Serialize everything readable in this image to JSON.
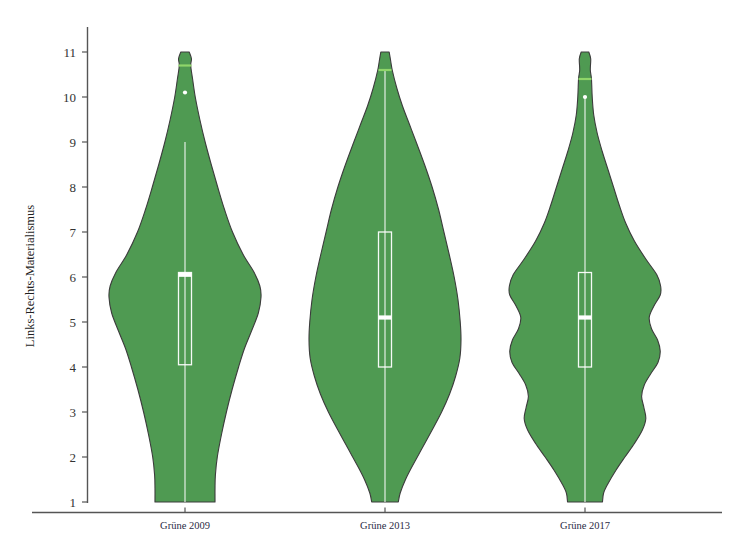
{
  "chart_data": {
    "type": "violin",
    "title": "",
    "subtitle": "",
    "xlabel": "",
    "ylabel": "Links-Rechts-Materialismus",
    "categories": [
      "Grüne 2009",
      "Grüne 2013",
      "Grüne 2017"
    ],
    "ylim": [
      1,
      11
    ],
    "yticks": [
      1,
      2,
      3,
      4,
      5,
      6,
      7,
      8,
      9,
      10,
      11
    ],
    "ytick_labels": [
      "1",
      "2",
      "3",
      "4",
      "5",
      "6",
      "7",
      "8",
      "9",
      "10",
      "11"
    ],
    "grid": false,
    "legend": "none",
    "colors": {
      "violin_fill": "#4f9a52",
      "violin_outline": "#3c3c3c",
      "box_line": "#ffffff",
      "median_line": "#ffffff",
      "whisker_line": "#ffffff",
      "cap_line": "#8fd66a",
      "outlier_point": "#ffffff",
      "axis": "#555555",
      "background": "#ffffff"
    },
    "series": [
      {
        "name": "Grüne 2009",
        "box": {
          "q1": 4.05,
          "median": 6.05,
          "q3": 6.1
        },
        "whisker_low": 1.0,
        "whisker_high": 9.0,
        "cap_high": 10.7,
        "outliers": [
          10.1
        ],
        "density": [
          {
            "y": 11.0,
            "w": 0.055
          },
          {
            "y": 10.85,
            "w": 0.085
          },
          {
            "y": 10.7,
            "w": 0.075
          },
          {
            "y": 10.4,
            "w": 0.1
          },
          {
            "y": 10.0,
            "w": 0.135
          },
          {
            "y": 9.5,
            "w": 0.195
          },
          {
            "y": 9.0,
            "w": 0.265
          },
          {
            "y": 8.5,
            "w": 0.345
          },
          {
            "y": 8.0,
            "w": 0.43
          },
          {
            "y": 7.5,
            "w": 0.52
          },
          {
            "y": 7.0,
            "w": 0.625
          },
          {
            "y": 6.5,
            "w": 0.765
          },
          {
            "y": 6.1,
            "w": 0.91
          },
          {
            "y": 5.8,
            "w": 0.985
          },
          {
            "y": 5.55,
            "w": 1.0
          },
          {
            "y": 5.2,
            "w": 0.965
          },
          {
            "y": 4.8,
            "w": 0.875
          },
          {
            "y": 4.4,
            "w": 0.78
          },
          {
            "y": 4.0,
            "w": 0.705
          },
          {
            "y": 3.5,
            "w": 0.62
          },
          {
            "y": 3.0,
            "w": 0.545
          },
          {
            "y": 2.5,
            "w": 0.48
          },
          {
            "y": 2.0,
            "w": 0.425
          },
          {
            "y": 1.6,
            "w": 0.4
          },
          {
            "y": 1.3,
            "w": 0.395
          },
          {
            "y": 1.0,
            "w": 0.395
          }
        ]
      },
      {
        "name": "Grüne 2013",
        "box": {
          "q1": 4.0,
          "median": 5.1,
          "q3": 7.0
        },
        "whisker_low": 1.0,
        "whisker_high": 10.6,
        "cap_high": 10.6,
        "outliers": [],
        "density": [
          {
            "y": 11.0,
            "w": 0.055
          },
          {
            "y": 10.8,
            "w": 0.075
          },
          {
            "y": 10.6,
            "w": 0.095
          },
          {
            "y": 10.2,
            "w": 0.155
          },
          {
            "y": 9.8,
            "w": 0.23
          },
          {
            "y": 9.4,
            "w": 0.32
          },
          {
            "y": 9.0,
            "w": 0.41
          },
          {
            "y": 8.5,
            "w": 0.52
          },
          {
            "y": 8.0,
            "w": 0.62
          },
          {
            "y": 7.5,
            "w": 0.705
          },
          {
            "y": 7.0,
            "w": 0.775
          },
          {
            "y": 6.5,
            "w": 0.845
          },
          {
            "y": 6.0,
            "w": 0.91
          },
          {
            "y": 5.5,
            "w": 0.96
          },
          {
            "y": 5.0,
            "w": 0.99
          },
          {
            "y": 4.6,
            "w": 1.0
          },
          {
            "y": 4.2,
            "w": 0.985
          },
          {
            "y": 3.8,
            "w": 0.93
          },
          {
            "y": 3.4,
            "w": 0.85
          },
          {
            "y": 3.0,
            "w": 0.745
          },
          {
            "y": 2.6,
            "w": 0.62
          },
          {
            "y": 2.2,
            "w": 0.49
          },
          {
            "y": 1.8,
            "w": 0.36
          },
          {
            "y": 1.5,
            "w": 0.27
          },
          {
            "y": 1.2,
            "w": 0.2
          },
          {
            "y": 1.0,
            "w": 0.175
          }
        ]
      },
      {
        "name": "Grüne 2017",
        "box": {
          "q1": 4.0,
          "median": 5.1,
          "q3": 6.1
        },
        "whisker_low": 1.0,
        "whisker_high": 10.0,
        "cap_high": 10.4,
        "outliers": [
          10.0
        ],
        "density": [
          {
            "y": 11.0,
            "w": 0.05
          },
          {
            "y": 10.85,
            "w": 0.075
          },
          {
            "y": 10.6,
            "w": 0.07
          },
          {
            "y": 10.4,
            "w": 0.085
          },
          {
            "y": 10.0,
            "w": 0.095
          },
          {
            "y": 9.6,
            "w": 0.115
          },
          {
            "y": 9.2,
            "w": 0.16
          },
          {
            "y": 8.8,
            "w": 0.225
          },
          {
            "y": 8.4,
            "w": 0.3
          },
          {
            "y": 8.0,
            "w": 0.375
          },
          {
            "y": 7.6,
            "w": 0.45
          },
          {
            "y": 7.2,
            "w": 0.535
          },
          {
            "y": 6.8,
            "w": 0.65
          },
          {
            "y": 6.4,
            "w": 0.8
          },
          {
            "y": 6.05,
            "w": 0.945
          },
          {
            "y": 5.8,
            "w": 0.995
          },
          {
            "y": 5.6,
            "w": 0.99
          },
          {
            "y": 5.35,
            "w": 0.905
          },
          {
            "y": 5.1,
            "w": 0.845
          },
          {
            "y": 4.85,
            "w": 0.875
          },
          {
            "y": 4.6,
            "w": 0.955
          },
          {
            "y": 4.35,
            "w": 0.99
          },
          {
            "y": 4.1,
            "w": 0.96
          },
          {
            "y": 3.85,
            "w": 0.865
          },
          {
            "y": 3.6,
            "w": 0.78
          },
          {
            "y": 3.35,
            "w": 0.745
          },
          {
            "y": 3.1,
            "w": 0.775
          },
          {
            "y": 2.85,
            "w": 0.8
          },
          {
            "y": 2.6,
            "w": 0.755
          },
          {
            "y": 2.3,
            "w": 0.65
          },
          {
            "y": 2.0,
            "w": 0.525
          },
          {
            "y": 1.7,
            "w": 0.405
          },
          {
            "y": 1.4,
            "w": 0.3
          },
          {
            "y": 1.2,
            "w": 0.245
          },
          {
            "y": 1.0,
            "w": 0.23
          }
        ]
      }
    ]
  },
  "axes": {
    "y_axis_name": "y-axis",
    "x_axis_name": "x-axis"
  }
}
